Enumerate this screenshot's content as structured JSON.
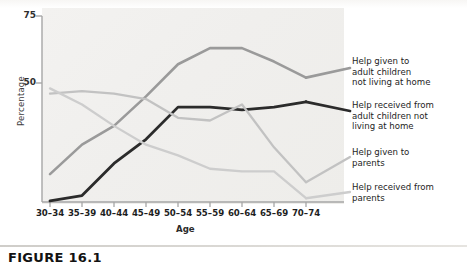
{
  "figure": {
    "caption": "FIGURE 16.1",
    "axis": {
      "ylabel": "Percentage",
      "xlabel": "Age",
      "yticks": [
        "75",
        "50"
      ]
    }
  },
  "legend": {
    "entries": [
      {
        "name": "help-given-adult-children",
        "lines": [
          "Help given to",
          "adult children",
          "not living at home"
        ],
        "color": "#9a9a9a"
      },
      {
        "name": "help-received-adult-children",
        "lines": [
          "Help received from",
          "adult children not",
          "living at home"
        ],
        "color": "#2b2b2b"
      },
      {
        "name": "help-given-parents",
        "lines": [
          "Help given to",
          "parents"
        ],
        "color": "#c2c2c2"
      },
      {
        "name": "help-received-parents",
        "lines": [
          "Help received from",
          "parents"
        ],
        "color": "#cdcdcd"
      }
    ]
  },
  "chart_data": {
    "type": "line",
    "title": "",
    "xlabel": "Age",
    "ylabel": "Percentage",
    "categories": [
      "30–34",
      "35–39",
      "40–44",
      "45–49",
      "50–54",
      "55–59",
      "60–64",
      "65–69",
      "70–74"
    ],
    "ylim": [
      5,
      75
    ],
    "yticks": [
      50,
      75
    ],
    "grid": false,
    "legend_position": "right",
    "series": [
      {
        "name": "Help given to adult children not living at home",
        "color": "#9a9a9a",
        "values": [
          16,
          27,
          34,
          45,
          57,
          63,
          63,
          58,
          52
        ]
      },
      {
        "name": "Help received from adult children not living at home",
        "color": "#2b2b2b",
        "values": [
          6,
          8,
          20,
          29,
          41,
          41,
          40,
          41,
          43
        ]
      },
      {
        "name": "Help given to parents",
        "color": "#c2c2c2",
        "values": [
          46,
          47,
          46,
          44,
          37,
          36,
          42,
          26,
          13
        ]
      },
      {
        "name": "Help received from parents",
        "color": "#cdcdcd",
        "values": [
          48,
          42,
          34,
          27,
          23,
          18,
          17,
          17,
          7
        ]
      }
    ]
  }
}
